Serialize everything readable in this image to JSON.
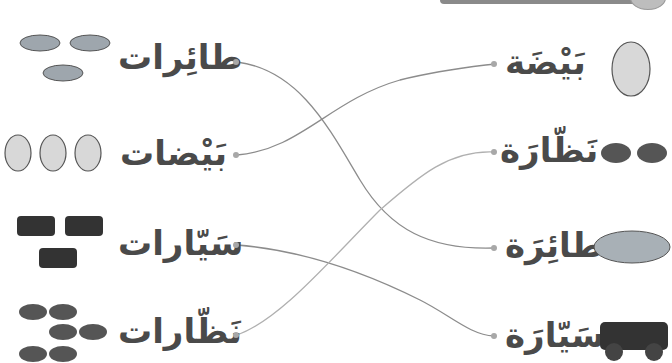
{
  "worksheet": {
    "left_column": [
      {
        "word": "طائِرات",
        "image": "three-airplanes",
        "count": 3
      },
      {
        "word": "بَيْضات",
        "image": "three-eggs",
        "count": 3
      },
      {
        "word": "سَيّارات",
        "image": "three-cars",
        "count": 3
      },
      {
        "word": "نَظّارات",
        "image": "three-sunglasses",
        "count": 3
      }
    ],
    "right_column": [
      {
        "word": "بَيْضَة",
        "image": "egg"
      },
      {
        "word": "نَظّارَة",
        "image": "sunglasses"
      },
      {
        "word": "طائِرَة",
        "image": "airplane"
      },
      {
        "word": "سَيّارَة",
        "image": "car"
      }
    ],
    "connections": [
      {
        "from": "طائِرات",
        "to": "طائِرَة"
      },
      {
        "from": "بَيْضات",
        "to": "بَيْضَة"
      },
      {
        "from": "سَيّارات",
        "to": "سَيّارَة"
      },
      {
        "from": "نَظّارات",
        "to": "نَظّارَة"
      }
    ],
    "line_color": "#8c8c8c",
    "text_color": "#4a4a4a"
  }
}
